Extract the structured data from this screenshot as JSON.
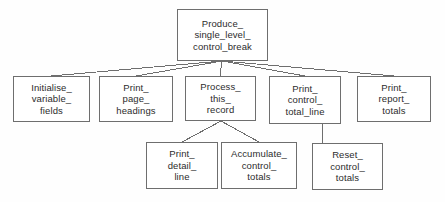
{
  "diagram": {
    "type": "structure-chart",
    "background_color": "#fefefe",
    "box_border_color": "#6e6e6e",
    "box_fill_color": "#ffffff",
    "connector_color": "#6e6e6e",
    "text_color": "#2c2c2c"
  },
  "nodes": [
    {
      "id": "produce-single-level-control-break",
      "name": "produce-single-level-control-break",
      "lines": [
        "Produce_",
        "single_level_",
        "control_break"
      ],
      "x": 177,
      "y": 9,
      "width": 91,
      "height": 52,
      "level": 0
    },
    {
      "id": "initialise-variable-fields",
      "name": "initialise-variable-fields",
      "lines": [
        "Initialise_",
        "variable_",
        "fields"
      ],
      "x": 13,
      "y": 76,
      "width": 77,
      "height": 46,
      "level": 1
    },
    {
      "id": "print-page-headings",
      "name": "print-page-headings",
      "lines": [
        "Print_",
        "page_",
        "headings"
      ],
      "x": 99,
      "y": 76,
      "width": 74,
      "height": 46,
      "level": 1
    },
    {
      "id": "process-this-record",
      "name": "process-this-record",
      "lines": [
        "Process_",
        "this_",
        "record"
      ],
      "x": 185,
      "y": 76,
      "width": 71,
      "height": 45,
      "level": 1
    },
    {
      "id": "print-control-total-line",
      "name": "print-control-total-line",
      "lines": [
        "Print_",
        "control_",
        "total_line"
      ],
      "x": 269,
      "y": 76,
      "width": 72,
      "height": 48,
      "level": 1
    },
    {
      "id": "print-report-totals",
      "name": "print-report-totals",
      "lines": [
        "Print_",
        "report_",
        "totals"
      ],
      "x": 357,
      "y": 76,
      "width": 74,
      "height": 46,
      "level": 1
    },
    {
      "id": "print-detail-line",
      "name": "print-detail-line",
      "lines": [
        "Print_",
        "detail_",
        "line"
      ],
      "x": 146,
      "y": 142,
      "width": 72,
      "height": 47,
      "level": 2
    },
    {
      "id": "accumulate-control-totals",
      "name": "accumulate-control-totals",
      "lines": [
        "Accumulate_",
        "control_",
        "totals"
      ],
      "x": 221,
      "y": 142,
      "width": 76,
      "height": 47,
      "level": 2
    },
    {
      "id": "reset-control-totals",
      "name": "reset-control-totals",
      "lines": [
        "Reset_",
        "control_",
        "totals"
      ],
      "x": 312,
      "y": 143,
      "width": 71,
      "height": 47,
      "level": 2
    }
  ],
  "connectors": [
    {
      "name": "connector-root-to-initialise",
      "from": "produce-single-level-control-break",
      "to": "initialise-variable-fields",
      "x1": 222,
      "y1": 61,
      "x2": 51,
      "y2": 76
    },
    {
      "name": "connector-root-to-print-page-headings",
      "from": "produce-single-level-control-break",
      "to": "print-page-headings",
      "x1": 222,
      "y1": 61,
      "x2": 136,
      "y2": 76
    },
    {
      "name": "connector-root-to-process-this-record",
      "from": "produce-single-level-control-break",
      "to": "process-this-record",
      "x1": 222,
      "y1": 61,
      "x2": 220,
      "y2": 76
    },
    {
      "name": "connector-root-to-print-control-total-line",
      "from": "produce-single-level-control-break",
      "to": "print-control-total-line",
      "x1": 222,
      "y1": 61,
      "x2": 305,
      "y2": 76
    },
    {
      "name": "connector-root-to-print-report-totals",
      "from": "produce-single-level-control-break",
      "to": "print-report-totals",
      "x1": 222,
      "y1": 61,
      "x2": 394,
      "y2": 76
    },
    {
      "name": "connector-process-to-print-detail-line",
      "from": "process-this-record",
      "to": "print-detail-line",
      "x1": 221,
      "y1": 121,
      "x2": 182,
      "y2": 142
    },
    {
      "name": "connector-process-to-accumulate-control-totals",
      "from": "process-this-record",
      "to": "accumulate-control-totals",
      "x1": 221,
      "y1": 121,
      "x2": 259,
      "y2": 142
    },
    {
      "name": "connector-print-control-total-line-to-reset-control-totals",
      "from": "print-control-total-line",
      "to": "reset-control-totals",
      "x1": 322,
      "y1": 124,
      "x2": 322,
      "y2": 143
    }
  ]
}
